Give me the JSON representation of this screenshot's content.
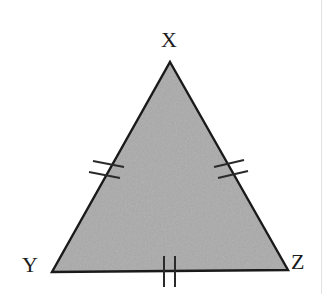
{
  "figure": {
    "kind": "geometry-diagram",
    "shape": "triangle",
    "canvas": {
      "width": 328,
      "height": 294,
      "background": "#ffffff"
    },
    "style": {
      "fill_color": "#a8a8a8",
      "fill_texture": "mottled-gray-noise",
      "stroke_color": "#1a1a1a",
      "stroke_width": 2.4,
      "label_color": "#1c1c1c",
      "tick_color": "#2a2a2a",
      "page_edge_color": "#e2e2e2"
    },
    "vertices": [
      {
        "name": "X",
        "label": "X",
        "x": 170,
        "y": 62,
        "label_x": 161,
        "label_y": 29
      },
      {
        "name": "Y",
        "label": "Y",
        "x": 52,
        "y": 272,
        "label_x": 22,
        "label_y": 254
      },
      {
        "name": "Z",
        "label": "Z",
        "x": 288,
        "y": 270,
        "label_x": 291,
        "label_y": 251
      }
    ],
    "sides": [
      {
        "name": "XY",
        "from": "X",
        "to": "Y",
        "tick_count": 2,
        "tick_center_x": 105,
        "tick_center_y": 168
      },
      {
        "name": "XZ",
        "from": "X",
        "to": "Z",
        "tick_count": 2,
        "tick_center_x": 228,
        "tick_center_y": 168
      },
      {
        "name": "YZ",
        "from": "Y",
        "to": "Z",
        "tick_count": 2,
        "tick_center_x": 169,
        "tick_center_y": 271
      }
    ]
  }
}
